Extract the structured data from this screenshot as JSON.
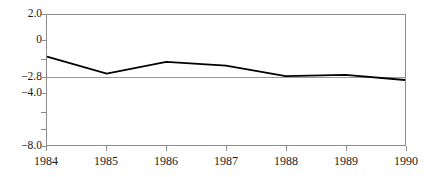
{
  "chart_data": {
    "type": "line",
    "title": "",
    "subtitle": "",
    "xlabel": "",
    "ylabel": "",
    "x": [
      1984,
      1985,
      1986,
      1987,
      1988,
      1989,
      1990
    ],
    "categories": [
      "1984",
      "1985",
      "1986",
      "1987",
      "1988",
      "1989",
      "1990"
    ],
    "values": [
      -1.2,
      -2.5,
      -1.6,
      -1.9,
      -2.7,
      -2.6,
      -3.0
    ],
    "series": [
      {
        "name": "series-1",
        "values": [
          -1.2,
          -2.5,
          -1.6,
          -1.9,
          -2.7,
          -2.6,
          -3.0
        ],
        "color": "#000000"
      }
    ],
    "xlim": [
      1984,
      1990
    ],
    "ylim": [
      -8.0,
      2.0
    ],
    "ytick_values": [
      2.0,
      0,
      -2.8,
      -4.0,
      -8.0
    ],
    "ytick_labels": [
      "2.0",
      "0",
      "−2.8",
      "−4.0",
      "−8.0"
    ],
    "xtick_values": [
      1984,
      1985,
      1986,
      1987,
      1988,
      1989,
      1990
    ],
    "xtick_labels": [
      "1984",
      "1985",
      "1986",
      "1987",
      "1988",
      "1989",
      "1990"
    ],
    "reference_lines": [
      {
        "name": "reference-line-neg-2-8",
        "axis": "y",
        "value": -2.8,
        "color": "#9a9a9a"
      }
    ],
    "grid": false,
    "legend": null,
    "legend_position": "none",
    "annotations": [],
    "axis_color": "#8c8c8c",
    "line_color": "#000000",
    "background_color": "#ffffff"
  }
}
